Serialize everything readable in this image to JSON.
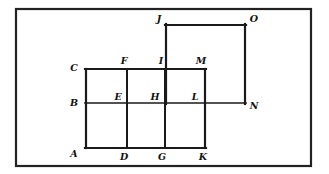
{
  "figure": {
    "canvas": {
      "width": 329,
      "height": 174
    },
    "frame": {
      "x": 16,
      "y": 9,
      "width": 295,
      "height": 157,
      "stroke": "#222222",
      "stroke_width": 2.2
    },
    "line_color": "#1a1a1a",
    "background": "#ffffff"
  },
  "chart_data": {
    "type": "diagram",
    "xlabel": "",
    "ylabel": "",
    "grid": false,
    "legend": "none",
    "x_columns": {
      "A": 86,
      "D": 127,
      "G": 165,
      "K": 205,
      "N": 245
    },
    "y_rows": {
      "top_J": 25,
      "row_C": 69,
      "row_B": 103,
      "row_A": 148
    },
    "points": [
      {
        "label": "A",
        "x": 86,
        "y": 148,
        "label_x": 74,
        "label_y": 154,
        "anchor": "middle"
      },
      {
        "label": "B",
        "x": 86,
        "y": 103,
        "label_x": 74,
        "label_y": 103,
        "anchor": "middle"
      },
      {
        "label": "C",
        "x": 86,
        "y": 69,
        "label_x": 74,
        "label_y": 68,
        "anchor": "middle"
      },
      {
        "label": "D",
        "x": 127,
        "y": 148,
        "label_x": 124,
        "label_y": 157,
        "anchor": "middle"
      },
      {
        "label": "E",
        "x": 127,
        "y": 103,
        "label_x": 118,
        "label_y": 97,
        "anchor": "middle"
      },
      {
        "label": "F",
        "x": 127,
        "y": 69,
        "label_x": 124,
        "label_y": 61,
        "anchor": "middle"
      },
      {
        "label": "G",
        "x": 165,
        "y": 148,
        "label_x": 162,
        "label_y": 157,
        "anchor": "middle"
      },
      {
        "label": "H",
        "x": 165,
        "y": 103,
        "label_x": 155,
        "label_y": 97,
        "anchor": "middle"
      },
      {
        "label": "I",
        "x": 165,
        "y": 69,
        "label_x": 161,
        "label_y": 61,
        "anchor": "middle"
      },
      {
        "label": "J",
        "x": 166,
        "y": 25,
        "label_x": 159,
        "label_y": 19,
        "anchor": "middle"
      },
      {
        "label": "K",
        "x": 205,
        "y": 148,
        "label_x": 203,
        "label_y": 157,
        "anchor": "middle"
      },
      {
        "label": "L",
        "x": 205,
        "y": 103,
        "label_x": 195,
        "label_y": 97,
        "anchor": "middle"
      },
      {
        "label": "M",
        "x": 205,
        "y": 69,
        "label_x": 201,
        "label_y": 61,
        "anchor": "middle"
      },
      {
        "label": "N",
        "x": 245,
        "y": 103,
        "label_x": 254,
        "label_y": 106,
        "anchor": "middle"
      },
      {
        "label": "O",
        "x": 245,
        "y": 25,
        "label_x": 254,
        "label_y": 19,
        "anchor": "middle"
      }
    ],
    "segments": [
      {
        "name": "A-C",
        "x1": 86,
        "y1": 148,
        "x2": 86,
        "y2": 69,
        "width": 2.2
      },
      {
        "name": "C-M",
        "x1": 85,
        "y1": 69,
        "x2": 206,
        "y2": 69,
        "width": 2.2
      },
      {
        "name": "A-K",
        "x1": 85,
        "y1": 148,
        "x2": 206,
        "y2": 148,
        "width": 2.2
      },
      {
        "name": "M-K",
        "x1": 205,
        "y1": 69,
        "x2": 205,
        "y2": 148,
        "width": 2.2
      },
      {
        "name": "F-D",
        "x1": 127,
        "y1": 69,
        "x2": 127,
        "y2": 148,
        "width": 2.0
      },
      {
        "name": "I-G",
        "x1": 165,
        "y1": 69,
        "x2": 165,
        "y2": 148,
        "width": 2.0
      },
      {
        "name": "B-N",
        "x1": 85,
        "y1": 103,
        "x2": 246,
        "y2": 103,
        "width": 1.7
      },
      {
        "name": "J-O",
        "x1": 165,
        "y1": 25,
        "x2": 246,
        "y2": 25,
        "width": 2.2
      },
      {
        "name": "J-I",
        "x1": 166,
        "y1": 24,
        "x2": 166,
        "y2": 104,
        "width": 2.2
      },
      {
        "name": "O-N",
        "x1": 245,
        "y1": 24,
        "x2": 245,
        "y2": 104,
        "width": 2.2
      }
    ]
  }
}
